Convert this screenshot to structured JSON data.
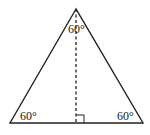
{
  "diagram": {
    "type": "equilateral-triangle-with-altitude",
    "colors": {
      "stroke": "#222222",
      "background": "#ffffff"
    },
    "vertices": {
      "apex": [
        76,
        9
      ],
      "base_left": [
        10,
        123
      ],
      "base_right": [
        143,
        123
      ]
    },
    "altitude": {
      "from": [
        76,
        9
      ],
      "to": [
        76,
        123
      ],
      "style": "dashed"
    },
    "right_angle_marker": {
      "x": 76,
      "y": 115,
      "size": 8
    },
    "labels": {
      "apex_angle": "60°",
      "left_angle": "60°",
      "right_angle": "60°"
    }
  }
}
